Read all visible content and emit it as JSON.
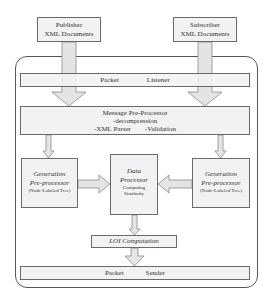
{
  "inputs": {
    "publisher": {
      "line1": "Publisher",
      "line2": "XML Documents"
    },
    "subscriber": {
      "line1": "Subscriber",
      "line2": "XML Documents"
    }
  },
  "packet_listener": {
    "word1": "Packet",
    "word2": "Listener"
  },
  "message_preprocessor": {
    "title": "Message Pre-Processor",
    "item1": "-decompression",
    "item2": "-XML Parser",
    "item3": "-Validation"
  },
  "generation_left": {
    "line1": "Generation",
    "line2": "Pre-processor",
    "line3": "(Node-Labeled Tree)"
  },
  "generation_right": {
    "line1": "Generation",
    "line2": "Pre-processor",
    "line3": "(Node-Labeled Tree)"
  },
  "data_processor": {
    "line1": "Data",
    "line2": "Processor",
    "line3": "Computing",
    "line4": "Similarity"
  },
  "loi": {
    "label": "LOI Computation"
  },
  "packet_sender": {
    "word1": "Packet",
    "word2": "Sender"
  },
  "colors": {
    "box_fill": "#f2f2f2",
    "arrow_fill": "#e6e6e6",
    "border": "#6a6a6a"
  }
}
